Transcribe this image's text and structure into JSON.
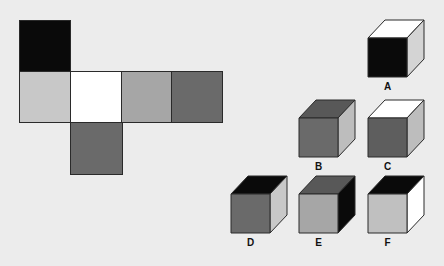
{
  "colors": {
    "background": "#ececec",
    "black": "#0a0a0a",
    "white": "#ffffff",
    "light_gray": "#c8c8c8",
    "mid_gray": "#a6a6a6",
    "dark_gray": "#6a6a6a",
    "darker_gray": "#585858",
    "edge": "#2a2a2a"
  },
  "net": {
    "faces": [
      {
        "id": "top",
        "color": "#0a0a0a",
        "x": 19,
        "y": 20,
        "size": 51
      },
      {
        "id": "left",
        "color": "#c8c8c8",
        "x": 19,
        "y": 71,
        "size": 51
      },
      {
        "id": "center",
        "color": "#ffffff",
        "x": 70,
        "y": 71,
        "size": 51
      },
      {
        "id": "right",
        "color": "#a6a6a6",
        "x": 121,
        "y": 71,
        "size": 51
      },
      {
        "id": "far",
        "color": "#6a6a6a",
        "x": 171,
        "y": 71,
        "size": 51
      },
      {
        "id": "bottom",
        "color": "#6a6a6a",
        "x": 70,
        "y": 122,
        "size": 52
      }
    ]
  },
  "cubes": [
    {
      "label": "A",
      "x": 368,
      "y": 38,
      "front": "#0a0a0a",
      "top": "#ffffff",
      "side": "#d4d4d4"
    },
    {
      "label": "B",
      "x": 299,
      "y": 118,
      "front": "#6a6a6a",
      "top": "#585858",
      "side": "#bdbdbd"
    },
    {
      "label": "C",
      "x": 368,
      "y": 118,
      "front": "#5e5e5e",
      "top": "#ffffff",
      "side": "#bdbdbd"
    },
    {
      "label": "D",
      "x": 231,
      "y": 194,
      "front": "#6a6a6a",
      "top": "#0a0a0a",
      "side": "#c8c8c8"
    },
    {
      "label": "E",
      "x": 299,
      "y": 194,
      "front": "#a6a6a6",
      "top": "#585858",
      "side": "#0a0a0a"
    },
    {
      "label": "F",
      "x": 368,
      "y": 194,
      "front": "#c0c0c0",
      "top": "#0a0a0a",
      "side": "#ffffff"
    }
  ],
  "cube_geometry": {
    "size": 39,
    "depth_x": 17,
    "depth_y": 18,
    "label_offset_y": 43
  }
}
